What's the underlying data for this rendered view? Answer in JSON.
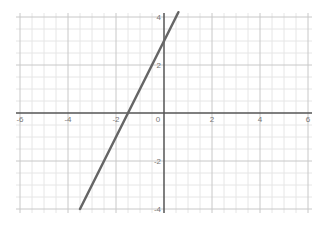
{
  "chart_data": {
    "type": "line",
    "title": "",
    "xlabel": "",
    "ylabel": "",
    "xlim": [
      -6,
      6
    ],
    "ylim": [
      -4,
      4
    ],
    "grid": true,
    "minor_grid_step": 0.5,
    "major_grid_step": 2,
    "x_tick_labels": [
      "-6",
      "-4",
      "-2",
      "0",
      "2",
      "4",
      "6"
    ],
    "y_tick_labels": [
      "4",
      "2",
      "-2",
      "-4"
    ],
    "series": [
      {
        "name": "y = 2x + 3",
        "equation": "y = 2x + 3",
        "slope": 2,
        "intercept": 3,
        "x": [
          -3.5,
          0.6
        ],
        "y": [
          -4,
          4.2
        ],
        "color": "#666666"
      }
    ],
    "legend": "none"
  },
  "colors": {
    "background": "#ffffff",
    "minor_grid": "#e6e6e6",
    "major_grid": "#c8c8c8",
    "axis": "#555555",
    "line": "#666666",
    "tick_text": "#777777"
  }
}
